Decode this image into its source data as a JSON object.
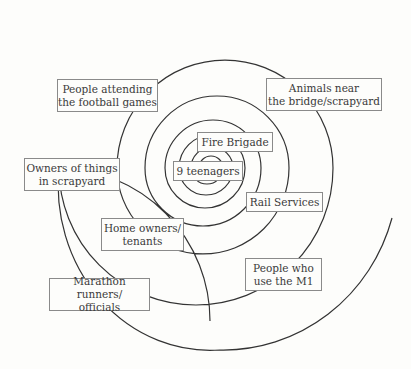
{
  "diagram": {
    "type": "concentric-spiral",
    "line_color": "#333333",
    "box_border_color": "#8a8a8a",
    "text_color": "#3a3a3a",
    "background": "#fdfdfb",
    "labels": [
      {
        "id": "nine-teenagers",
        "text": "9 teenagers",
        "ring": 1
      },
      {
        "id": "fire-brigade",
        "text": "Fire Brigade",
        "ring": 2
      },
      {
        "id": "rail-services",
        "text": "Rail Services",
        "ring": 3
      },
      {
        "id": "home-owners",
        "text": "Home owners/\ntenants",
        "ring": 4
      },
      {
        "id": "people-m1",
        "text": "People who\nuse the M1",
        "ring": 5
      },
      {
        "id": "football",
        "text": "People attending\nthe football games",
        "ring": 6
      },
      {
        "id": "animals",
        "text": "Animals near\nthe bridge/scrapyard",
        "ring": 7
      },
      {
        "id": "scrapyard-owners",
        "text": "Owners of things\nin scrapyard",
        "ring": 8
      },
      {
        "id": "marathon",
        "text": "Marathon runners/\nofficials",
        "ring": 9
      }
    ]
  }
}
